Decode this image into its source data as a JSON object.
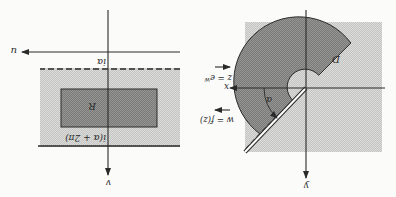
{
  "figure": {
    "orientation": "rotated 180 degrees",
    "left_panel": {
      "axis_horizontal_label": "u",
      "axis_vertical_label": "v",
      "upper_line_label": "iα",
      "lower_line_label": "i(α + 2π)",
      "region_label": "R"
    },
    "right_panel": {
      "axis_horizontal_label": "x",
      "axis_vertical_label": "y",
      "region_label": "D",
      "angle_label": "α"
    },
    "maps": {
      "forward": "z = e",
      "forward_exp": "w",
      "inverse": "w = f(z)"
    },
    "colors": {
      "light_fill": "#d3d3d1",
      "dark_fill": "#8a8a88",
      "line": "#2a2a2a"
    }
  }
}
